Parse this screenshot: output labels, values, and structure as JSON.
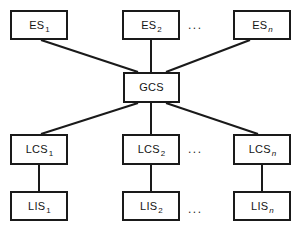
{
  "diagram": {
    "type": "block-diagram",
    "colors": {
      "background": "#ffffff",
      "stroke": "#1a1a1a",
      "text": "#141414"
    },
    "nodes": [
      {
        "id": "es1",
        "base": "ES",
        "sub": "1",
        "sub_italic": false,
        "x": 10,
        "y": 10,
        "w": 58,
        "h": 30
      },
      {
        "id": "es2",
        "base": "ES",
        "sub": "2",
        "sub_italic": false,
        "x": 122,
        "y": 10,
        "w": 58,
        "h": 30
      },
      {
        "id": "esn",
        "base": "ES",
        "sub": "n",
        "sub_italic": true,
        "x": 233,
        "y": 10,
        "w": 58,
        "h": 30
      },
      {
        "id": "gcs",
        "base": "GCS",
        "sub": "",
        "sub_italic": false,
        "x": 123,
        "y": 72,
        "w": 57,
        "h": 31
      },
      {
        "id": "lcs1",
        "base": "LCS",
        "sub": "1",
        "sub_italic": false,
        "x": 10,
        "y": 134,
        "w": 58,
        "h": 31
      },
      {
        "id": "lcs2",
        "base": "LCS",
        "sub": "2",
        "sub_italic": false,
        "x": 122,
        "y": 134,
        "w": 58,
        "h": 31
      },
      {
        "id": "lcsn",
        "base": "LCS",
        "sub": "n",
        "sub_italic": true,
        "x": 233,
        "y": 134,
        "w": 58,
        "h": 31
      },
      {
        "id": "lis1",
        "base": "LIS",
        "sub": "1",
        "sub_italic": false,
        "x": 10,
        "y": 191,
        "w": 58,
        "h": 30
      },
      {
        "id": "lis2",
        "base": "LIS",
        "sub": "2",
        "sub_italic": false,
        "x": 122,
        "y": 191,
        "w": 58,
        "h": 30
      },
      {
        "id": "lisn",
        "base": "LIS",
        "sub": "n",
        "sub_italic": true,
        "x": 233,
        "y": 191,
        "w": 58,
        "h": 30
      }
    ],
    "edges": [
      {
        "id": "es1-gcs",
        "from": "es1",
        "to": "gcs",
        "x1": 41,
        "y1": 40,
        "x2": 138,
        "y2": 72
      },
      {
        "id": "es2-gcs",
        "from": "es2",
        "to": "gcs",
        "x1": 151,
        "y1": 40,
        "x2": 151,
        "y2": 72
      },
      {
        "id": "esn-gcs",
        "from": "esn",
        "to": "gcs",
        "x1": 250,
        "y1": 40,
        "x2": 166,
        "y2": 72
      },
      {
        "id": "gcs-lcs1",
        "from": "gcs",
        "to": "lcs1",
        "x1": 138,
        "y1": 103,
        "x2": 41,
        "y2": 134
      },
      {
        "id": "gcs-lcs2",
        "from": "gcs",
        "to": "lcs2",
        "x1": 151,
        "y1": 103,
        "x2": 151,
        "y2": 134
      },
      {
        "id": "gcs-lcsn",
        "from": "gcs",
        "to": "lcsn",
        "x1": 166,
        "y1": 103,
        "x2": 258,
        "y2": 134
      },
      {
        "id": "lcs1-lis1",
        "from": "lcs1",
        "to": "lis1",
        "x1": 39,
        "y1": 165,
        "x2": 39,
        "y2": 191
      },
      {
        "id": "lcs2-lis2",
        "from": "lcs2",
        "to": "lis2",
        "x1": 151,
        "y1": 165,
        "x2": 151,
        "y2": 191
      },
      {
        "id": "lcsn-lisn",
        "from": "lcsn",
        "to": "lisn",
        "x1": 262,
        "y1": 165,
        "x2": 262,
        "y2": 191
      }
    ],
    "ellipses": [
      {
        "id": "es-row-ellipsis",
        "text": "...",
        "x": 188,
        "y": 19
      },
      {
        "id": "lcs-row-ellipsis",
        "text": "...",
        "x": 188,
        "y": 143
      },
      {
        "id": "lis-row-ellipsis",
        "text": "...",
        "x": 188,
        "y": 203
      }
    ]
  }
}
